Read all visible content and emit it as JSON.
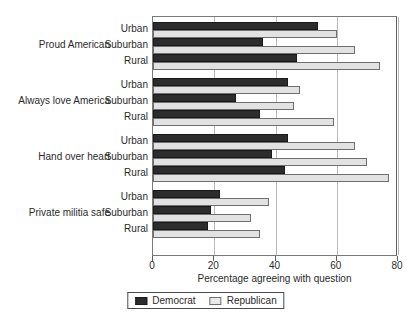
{
  "chart_data": {
    "type": "bar",
    "orientation": "horizontal",
    "title": "",
    "xlabel": "Percentage agreeing with question",
    "ylabel": "",
    "xlim": [
      0,
      80
    ],
    "xticks": [
      0,
      20,
      40,
      60,
      80
    ],
    "grid": true,
    "legend_position": "bottom",
    "groups": [
      {
        "label": "Proud American",
        "categories": [
          "Urban",
          "Suburban",
          "Rural"
        ],
        "Democrat": [
          54,
          36,
          47
        ],
        "Republican": [
          60,
          66,
          74
        ]
      },
      {
        "label": "Always love America",
        "categories": [
          "Urban",
          "Suburban",
          "Rural"
        ],
        "Democrat": [
          44,
          27,
          35
        ],
        "Republican": [
          48,
          46,
          59
        ]
      },
      {
        "label": "Hand over heart",
        "categories": [
          "Urban",
          "Suburban",
          "Rural"
        ],
        "Democrat": [
          44,
          39,
          43
        ],
        "Republican": [
          66,
          70,
          77
        ]
      },
      {
        "label": "Private militia safe",
        "categories": [
          "Urban",
          "Suburban",
          "Rural"
        ],
        "Democrat": [
          22,
          19,
          18
        ],
        "Republican": [
          38,
          32,
          35
        ]
      }
    ],
    "series": [
      {
        "name": "Democrat",
        "color": "#2c2c2c",
        "values": [
          54,
          36,
          47,
          44,
          27,
          35,
          44,
          39,
          43,
          22,
          19,
          18
        ]
      },
      {
        "name": "Republican",
        "color": "#e2e2e2",
        "values": [
          60,
          66,
          74,
          48,
          46,
          59,
          66,
          70,
          77,
          38,
          32,
          35
        ]
      }
    ]
  },
  "legend": {
    "items": [
      {
        "label": "Democrat",
        "swatch": "dem"
      },
      {
        "label": "Republican",
        "swatch": "rep"
      }
    ]
  }
}
